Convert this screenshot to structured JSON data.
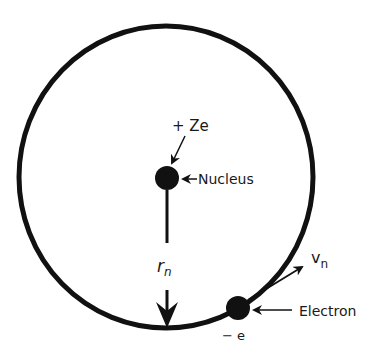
{
  "diagram": {
    "type": "bohr-atom-model",
    "orbit": {
      "cx": 166,
      "cy": 177,
      "r": 150,
      "stroke_width": 5
    },
    "nucleus": {
      "cx": 167,
      "cy": 178,
      "r": 12,
      "charge_label": "+ Ze",
      "name_label": "Nucleus"
    },
    "electron": {
      "cx": 238,
      "cy": 308,
      "r": 12,
      "charge_label": "− e",
      "name_label": "Electron"
    },
    "radius": {
      "label_main": "r",
      "label_sub": "n"
    },
    "velocity": {
      "label_main": "v",
      "label_sub": "n"
    },
    "colors": {
      "ink": "#111111",
      "background": "#ffffff"
    }
  }
}
